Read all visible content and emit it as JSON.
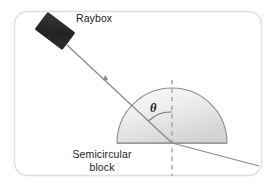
{
  "figure": {
    "frame": {
      "border_color": "#d9dde0",
      "background_color": "#ffffff"
    },
    "labels": {
      "raybox": "Raybox",
      "block_line1": "Semicircular",
      "block_line2": "block",
      "angle_symbol": "θ"
    },
    "colors": {
      "raybox_fill": "#2b2b2b",
      "ray_stroke": "#8a8a8a",
      "block_outline": "#8d8d8d",
      "block_fill_light": "#f4f4f4",
      "block_fill_dark": "#d7d7d7",
      "normal_dash": "#9a9a9a",
      "text": "#232323"
    },
    "geometry": {
      "semicircle_center_x": 172,
      "semicircle_center_y": 143,
      "semicircle_radius": 55,
      "incidence_point_x": 172,
      "incidence_point_y": 143,
      "normal_top_y": 80,
      "normal_bottom_y": 176,
      "incident_ray_start_x": 66,
      "incident_ray_start_y": 44,
      "refracted_ray_end_x": 259,
      "refracted_ray_end_y": 166,
      "raybox_center_x": 55,
      "raybox_center_y": 31,
      "raybox_width": 34,
      "raybox_height": 21,
      "raybox_rotation_deg": 37
    }
  }
}
